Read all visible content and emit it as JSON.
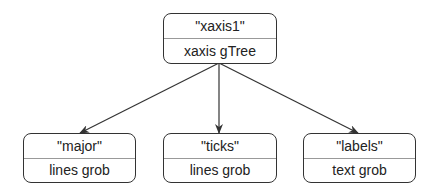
{
  "diagram": {
    "type": "tree",
    "root": {
      "name": "\"xaxis1\"",
      "kind": "xaxis gTree"
    },
    "children": [
      {
        "name": "\"major\"",
        "kind": "lines grob"
      },
      {
        "name": "\"ticks\"",
        "kind": "lines grob"
      },
      {
        "name": "\"labels\"",
        "kind": "text grob"
      }
    ],
    "edges": [
      {
        "from": "xaxis1",
        "to": "major"
      },
      {
        "from": "xaxis1",
        "to": "ticks"
      },
      {
        "from": "xaxis1",
        "to": "labels"
      }
    ],
    "colors": {
      "stroke": "#333333",
      "divider": "#999999",
      "text": "#222222",
      "background": "#ffffff"
    }
  }
}
